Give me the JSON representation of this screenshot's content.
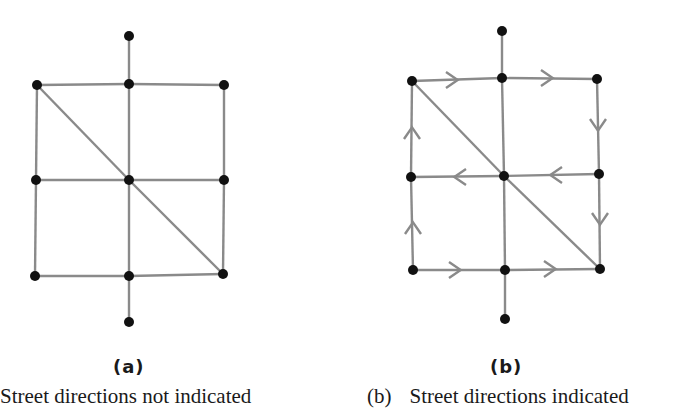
{
  "figure": {
    "colors": {
      "edge": "#8a8a8a",
      "node": "#111111",
      "arrow": "#8a8a8a"
    },
    "panels": [
      {
        "id": "a",
        "label": "(a)",
        "caption_marker": "",
        "caption": "Street directions not indicated",
        "nodes": {
          "top": [
            129,
            36
          ],
          "tl": [
            37,
            85
          ],
          "tm": [
            129,
            84
          ],
          "tr": [
            224,
            85
          ],
          "ml": [
            36,
            180
          ],
          "c": [
            129,
            180
          ],
          "mr": [
            224,
            180
          ],
          "bl": [
            35,
            276
          ],
          "bm": [
            129,
            276
          ],
          "br": [
            223,
            274
          ],
          "bottom": [
            129,
            322
          ]
        },
        "edges": [
          [
            "top",
            "tm"
          ],
          [
            "tl",
            "tm"
          ],
          [
            "tm",
            "tr"
          ],
          [
            "tl",
            "ml"
          ],
          [
            "ml",
            "bl"
          ],
          [
            "tr",
            "mr"
          ],
          [
            "mr",
            "br"
          ],
          [
            "tm",
            "c"
          ],
          [
            "c",
            "bm"
          ],
          [
            "bm",
            "bottom"
          ],
          [
            "ml",
            "c"
          ],
          [
            "c",
            "mr"
          ],
          [
            "bl",
            "bm"
          ],
          [
            "bm",
            "br"
          ],
          [
            "tl",
            "c"
          ],
          [
            "c",
            "br"
          ]
        ],
        "arrows": []
      },
      {
        "id": "b",
        "label": "(b)",
        "caption_marker": "(b)",
        "caption": "Street directions indicated",
        "nodes": {
          "top": [
            502,
            31
          ],
          "tl": [
            412,
            81
          ],
          "tm": [
            502,
            78
          ],
          "tr": [
            597,
            79
          ],
          "ml": [
            411,
            177
          ],
          "c": [
            504,
            176
          ],
          "mr": [
            599,
            174
          ],
          "bl": [
            413,
            270
          ],
          "bm": [
            505,
            270
          ],
          "br": [
            600,
            269
          ],
          "bottom": [
            505,
            319
          ]
        },
        "edges": [
          [
            "top",
            "tm"
          ],
          [
            "tl",
            "tm"
          ],
          [
            "tm",
            "tr"
          ],
          [
            "tl",
            "ml"
          ],
          [
            "ml",
            "bl"
          ],
          [
            "tr",
            "mr"
          ],
          [
            "mr",
            "br"
          ],
          [
            "tm",
            "c"
          ],
          [
            "c",
            "bm"
          ],
          [
            "bm",
            "bottom"
          ],
          [
            "ml",
            "c"
          ],
          [
            "c",
            "mr"
          ],
          [
            "bl",
            "bm"
          ],
          [
            "bm",
            "br"
          ],
          [
            "tl",
            "c"
          ],
          [
            "c",
            "br"
          ]
        ],
        "arrows": [
          {
            "at": [
              455,
              80
            ],
            "dir": "right"
          },
          {
            "at": [
              550,
              78
            ],
            "dir": "right"
          },
          {
            "at": [
              598,
              128
            ],
            "dir": "down"
          },
          {
            "at": [
              600,
              222
            ],
            "dir": "down"
          },
          {
            "at": [
              553,
              175
            ],
            "dir": "left"
          },
          {
            "at": [
              457,
              177
            ],
            "dir": "left"
          },
          {
            "at": [
              412,
              130
            ],
            "dir": "up"
          },
          {
            "at": [
              413,
              225
            ],
            "dir": "up"
          },
          {
            "at": [
              458,
              270
            ],
            "dir": "right"
          },
          {
            "at": [
              553,
              269
            ],
            "dir": "right"
          }
        ]
      }
    ]
  }
}
